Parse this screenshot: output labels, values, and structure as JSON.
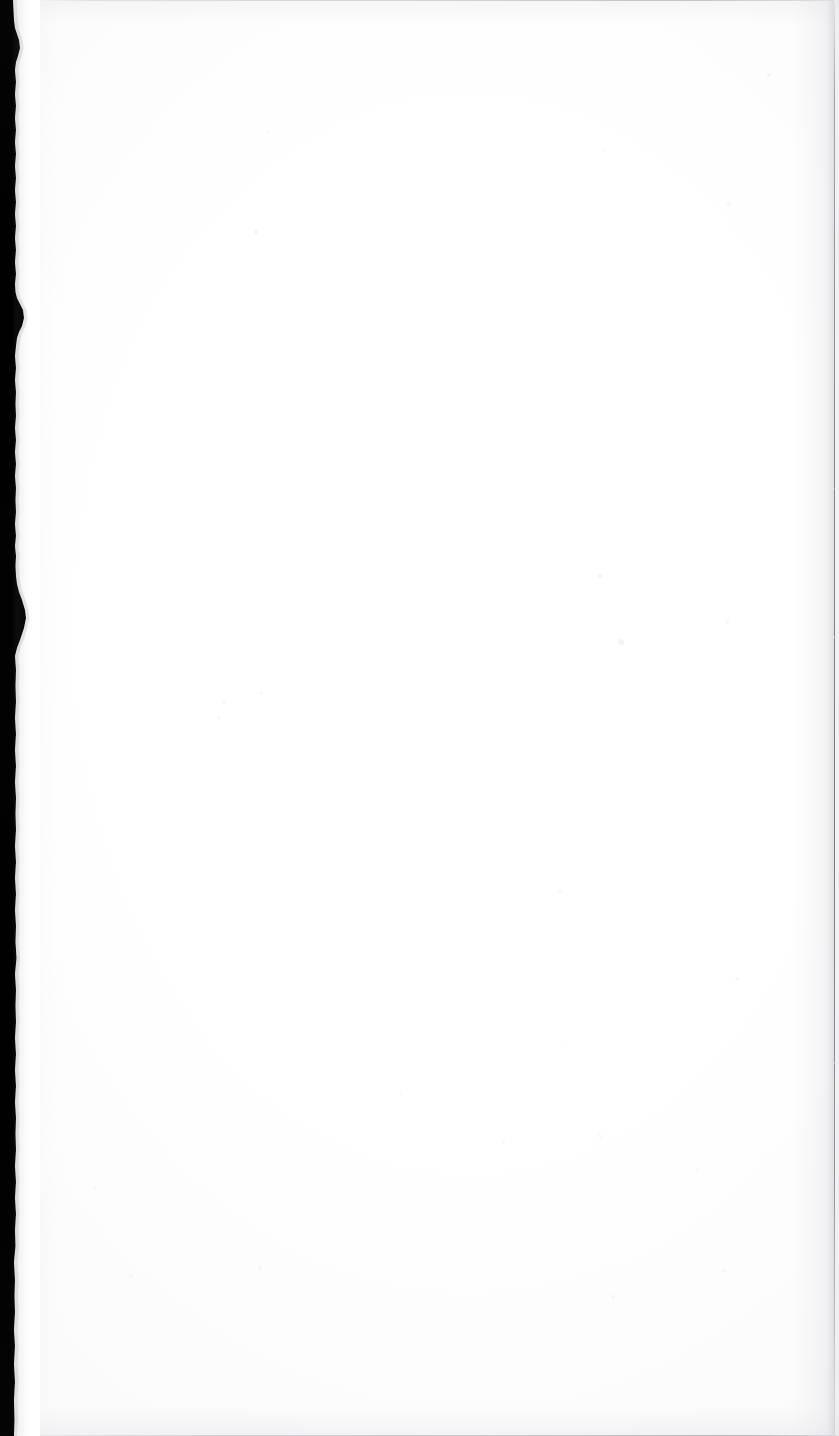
{
  "document": {
    "kind": "scanned-page-image",
    "page_state": "blank",
    "visible_text": "",
    "notes": "No printed text, headings, figures, page numbers or marginalia are rendered anywhere in this scan."
  },
  "canvas": {
    "width": 839,
    "height": 1436,
    "paper_color": "#ffffff",
    "paper_tint": "#fdfdfe"
  },
  "regions": {
    "gutter": {
      "label": "scanner gutter shadow",
      "side": "left",
      "color": "#000000",
      "width_px_top": 13,
      "width_px_mid": 17,
      "width_px_bottom": 14,
      "edge": "torn-irregular"
    },
    "paper": {
      "label": "blank paper surface",
      "color": "#ffffff"
    },
    "edges": {
      "top_line_color": "#c6c6cc",
      "bottom_line_color": "#bcbcc4",
      "right_line_color": "#80808a"
    }
  },
  "artifacts": {
    "label": "dust specks",
    "color": "#e9e9ee",
    "items": [
      {
        "x": 769,
        "y": 75,
        "r": 2.2,
        "o": 0.55
      },
      {
        "x": 805,
        "y": 105,
        "r": 1.4,
        "o": 0.35
      },
      {
        "x": 814,
        "y": 163,
        "r": 1.3,
        "o": 0.3
      },
      {
        "x": 729,
        "y": 204,
        "r": 1.6,
        "o": 0.3
      },
      {
        "x": 268,
        "y": 131,
        "r": 1.5,
        "o": 0.28
      },
      {
        "x": 256,
        "y": 232,
        "r": 2.0,
        "o": 0.4
      },
      {
        "x": 603,
        "y": 150,
        "r": 1.5,
        "o": 0.26
      },
      {
        "x": 600,
        "y": 576,
        "r": 2.4,
        "o": 0.48
      },
      {
        "x": 621,
        "y": 642,
        "r": 2.6,
        "o": 0.52
      },
      {
        "x": 727,
        "y": 622,
        "r": 1.8,
        "o": 0.32
      },
      {
        "x": 833,
        "y": 488,
        "r": 1.5,
        "o": 0.3
      },
      {
        "x": 836,
        "y": 637,
        "r": 2.0,
        "o": 0.45
      },
      {
        "x": 224,
        "y": 702,
        "r": 2.0,
        "o": 0.34
      },
      {
        "x": 219,
        "y": 718,
        "r": 1.8,
        "o": 0.3
      },
      {
        "x": 261,
        "y": 693,
        "r": 1.6,
        "o": 0.28
      },
      {
        "x": 560,
        "y": 891,
        "r": 1.8,
        "o": 0.3
      },
      {
        "x": 737,
        "y": 979,
        "r": 2.0,
        "o": 0.36
      },
      {
        "x": 836,
        "y": 1063,
        "r": 2.2,
        "o": 0.42
      },
      {
        "x": 828,
        "y": 903,
        "r": 1.6,
        "o": 0.28
      },
      {
        "x": 503,
        "y": 1142,
        "r": 1.7,
        "o": 0.3
      },
      {
        "x": 599,
        "y": 1135,
        "r": 1.6,
        "o": 0.28
      },
      {
        "x": 400,
        "y": 1093,
        "r": 1.5,
        "o": 0.26
      },
      {
        "x": 260,
        "y": 1268,
        "r": 1.7,
        "o": 0.28
      },
      {
        "x": 601,
        "y": 1138,
        "r": 1.5,
        "o": 0.26
      },
      {
        "x": 697,
        "y": 1170,
        "r": 1.6,
        "o": 0.28
      },
      {
        "x": 724,
        "y": 1271,
        "r": 1.8,
        "o": 0.32
      },
      {
        "x": 613,
        "y": 1297,
        "r": 1.7,
        "o": 0.3
      },
      {
        "x": 771,
        "y": 1080,
        "r": 1.4,
        "o": 0.24
      },
      {
        "x": 131,
        "y": 1276,
        "r": 1.6,
        "o": 0.26
      },
      {
        "x": 95,
        "y": 1188,
        "r": 1.5,
        "o": 0.3
      },
      {
        "x": 299,
        "y": 716,
        "r": 1.4,
        "o": 0.24
      },
      {
        "x": 564,
        "y": 1043,
        "r": 1.4,
        "o": 0.22
      }
    ]
  },
  "tear_profile": {
    "label": "irregular torn paper edge along the gutter",
    "description": "white paper protrudes over the black band at several points; two pronounced wedge-shaped protrusions near the upper-middle and lower-middle of the page"
  }
}
